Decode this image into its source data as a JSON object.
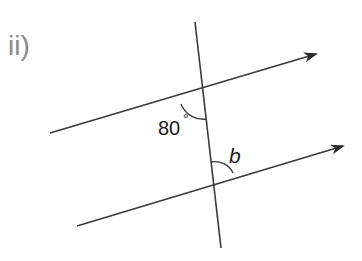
{
  "part_label": "ii)",
  "angles": {
    "known": {
      "value": "80",
      "unit": "°",
      "label": "80°"
    },
    "unknown": {
      "label": "b"
    }
  },
  "lines": {
    "transversal": {
      "x1": 195,
      "y1": 22,
      "x2": 221,
      "y2": 248
    },
    "upper_parallel": {
      "x1": 50,
      "y1": 133,
      "x2": 316,
      "y2": 54,
      "arrow": true
    },
    "lower_parallel": {
      "x1": 77,
      "y1": 226,
      "x2": 343,
      "y2": 146,
      "arrow": true
    }
  },
  "colors": {
    "line": "#3a3a3a",
    "label": "#8a8a8a",
    "text": "#1a1a1a"
  }
}
